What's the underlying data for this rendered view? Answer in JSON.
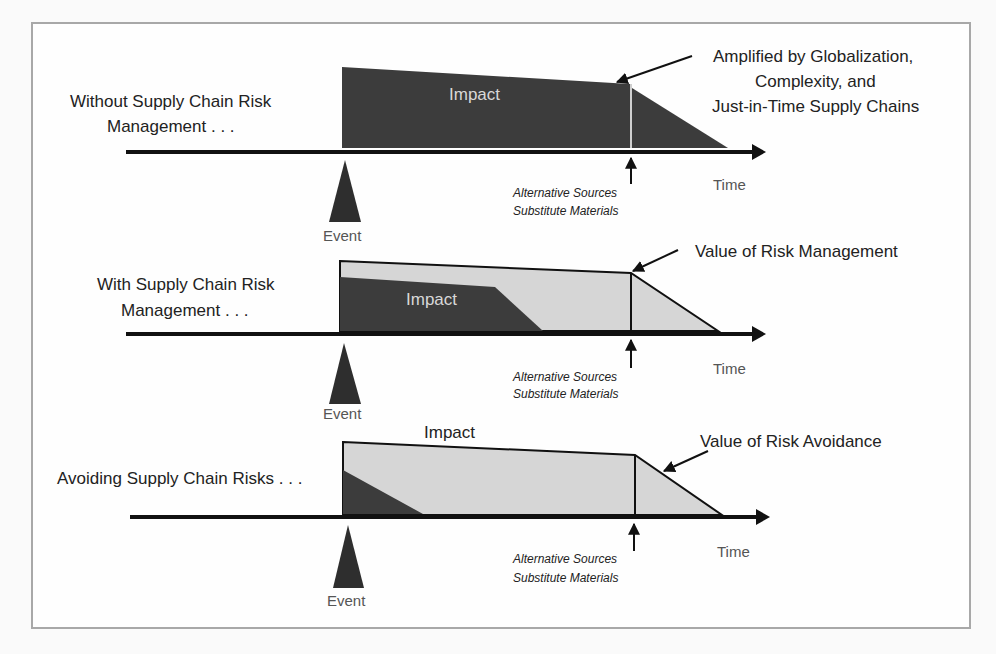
{
  "colors": {
    "dark_fill": "#3c3c3c",
    "light_fill": "#d6d6d6",
    "axis": "#111111",
    "frame": "#a8a8a8",
    "text": "#222222"
  },
  "common": {
    "event_label": "Event",
    "time_label": "Time",
    "impact_label": "Impact",
    "alt_sources_line1": "Alternative Sources",
    "alt_sources_line2": "Substitute Materials"
  },
  "panels": [
    {
      "id": "without",
      "title_line1": "Without Supply Chain Risk",
      "title_line2": "Management . . .",
      "callout_line1": "Amplified by Globalization,",
      "callout_line2": "Complexity, and",
      "callout_line3": "Just-in-Time Supply Chains"
    },
    {
      "id": "with",
      "title_line1": "With Supply Chain Risk",
      "title_line2": "Management . . .",
      "callout_line1": "Value of Risk Management"
    },
    {
      "id": "avoiding",
      "title_line1": "Avoiding Supply Chain Risks . . .",
      "callout_line1": "Value of Risk Avoidance"
    }
  ]
}
